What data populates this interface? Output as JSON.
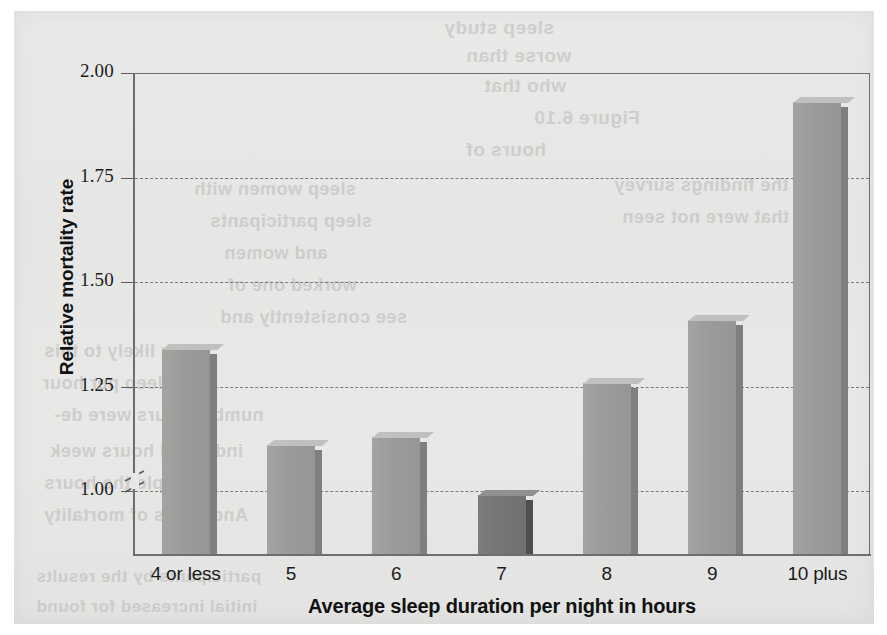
{
  "figure": {
    "media": "scanned-textbook-page",
    "background_color": "#e7e7e6",
    "bar_color": "#9b9b99",
    "highlight_bar_color": "#757573",
    "axis_color": "#6e6e6e"
  },
  "chart_data": {
    "type": "bar",
    "title": "",
    "xlabel": "Average sleep duration per night in hours",
    "ylabel": "Relative mortality rate",
    "categories": [
      "4 or less",
      "5",
      "6",
      "7",
      "8",
      "9",
      "10 plus"
    ],
    "values": [
      1.34,
      1.11,
      1.13,
      0.99,
      1.26,
      1.41,
      1.93
    ],
    "highlight_index": 3,
    "ylim": [
      0.85,
      2.0
    ],
    "yticks": [
      "1.00",
      "1.25",
      "1.50",
      "1.75",
      "2.00"
    ],
    "ytick_values": [
      1.0,
      1.25,
      1.5,
      1.75,
      2.0
    ],
    "grid": true,
    "grid_style": "dashed",
    "legend": "none",
    "axis_break": true,
    "axis_break_note": "y-axis broken below 1.00"
  },
  "bleed_through_text": {
    "line1": "sleep study",
    "line2": "worse than",
    "line3": "who that",
    "line4": "Figure 6.10",
    "line5": "hours of",
    "line6": "sleep women with",
    "line7": "sleep participants",
    "line8": "and women",
    "line9": "worked one of",
    "line10": "see consistently and",
    "line11": "week likely to this",
    "line12": "a sleep per hour",
    "line13": "number hours were de-",
    "line14": "indicated hours week",
    "line15": "people the hours",
    "line16": "And hours of mortality",
    "line17": "participants by the results",
    "line18": "initial increased for found",
    "line19": "the findings survey",
    "line20": "that were not seen"
  }
}
